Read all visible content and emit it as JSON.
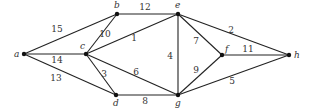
{
  "graph": {
    "nodes": [
      {
        "id": "a",
        "label": "a",
        "x": 24,
        "y": 54,
        "lx": 14,
        "ly": 57
      },
      {
        "id": "b",
        "label": "b",
        "x": 117,
        "y": 14,
        "lx": 114,
        "ly": 8
      },
      {
        "id": "c",
        "label": "c",
        "x": 86,
        "y": 54,
        "lx": 80,
        "ly": 49
      },
      {
        "id": "d",
        "label": "d",
        "x": 116,
        "y": 95,
        "lx": 113,
        "ly": 106
      },
      {
        "id": "e",
        "label": "e",
        "x": 178,
        "y": 14,
        "lx": 175,
        "ly": 8
      },
      {
        "id": "f",
        "label": "f",
        "x": 222,
        "y": 55,
        "lx": 225,
        "ly": 52
      },
      {
        "id": "g",
        "label": "g",
        "x": 178,
        "y": 95,
        "lx": 175,
        "ly": 106
      },
      {
        "id": "h",
        "label": "h",
        "x": 289,
        "y": 55,
        "lx": 294,
        "ly": 58
      }
    ],
    "edges": [
      {
        "from": "a",
        "to": "b",
        "weight": "15",
        "lx": 57,
        "ly": 32
      },
      {
        "from": "a",
        "to": "c",
        "weight": "14",
        "lx": 57,
        "ly": 63
      },
      {
        "from": "a",
        "to": "d",
        "weight": "13",
        "lx": 56,
        "ly": 81
      },
      {
        "from": "b",
        "to": "c",
        "weight": "10",
        "lx": 105,
        "ly": 37
      },
      {
        "from": "b",
        "to": "e",
        "weight": "12",
        "lx": 145,
        "ly": 10
      },
      {
        "from": "c",
        "to": "e",
        "weight": "1",
        "lx": 134,
        "ly": 41
      },
      {
        "from": "c",
        "to": "d",
        "weight": "3",
        "lx": 104,
        "ly": 77
      },
      {
        "from": "c",
        "to": "g",
        "weight": "6",
        "lx": 136,
        "ly": 75
      },
      {
        "from": "d",
        "to": "g",
        "weight": "8",
        "lx": 145,
        "ly": 104
      },
      {
        "from": "e",
        "to": "g",
        "weight": "4",
        "lx": 170,
        "ly": 59
      },
      {
        "from": "e",
        "to": "f",
        "weight": "7",
        "lx": 196,
        "ly": 44
      },
      {
        "from": "e",
        "to": "h",
        "weight": "2",
        "lx": 231,
        "ly": 33
      },
      {
        "from": "f",
        "to": "h",
        "weight": "11",
        "lx": 248,
        "ly": 52
      },
      {
        "from": "f",
        "to": "g",
        "weight": "9",
        "lx": 196,
        "ly": 73
      },
      {
        "from": "g",
        "to": "h",
        "weight": "5",
        "lx": 232,
        "ly": 84
      }
    ]
  }
}
